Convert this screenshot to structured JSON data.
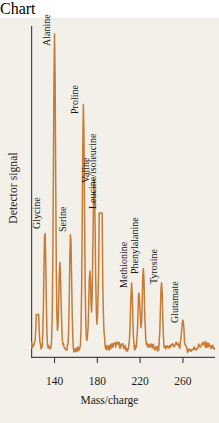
{
  "chart_data": {
    "type": "line",
    "title": "",
    "xlabel": "Mass/charge",
    "ylabel": "Detector signal",
    "xlim": [
      118,
      290
    ],
    "ylim": [
      0,
      100
    ],
    "grid": false,
    "legend": "none",
    "xticks": [
      140,
      180,
      220,
      260
    ],
    "xtick_labels": [
      "140",
      "180",
      "220",
      "260"
    ],
    "yticks": [],
    "ytick_labels": [],
    "series_name": "Detector signal",
    "trace_color": "#c77b35",
    "background_color": "#f3f0ea",
    "axis_color": "#3a3a3a",
    "baseline_level": 3,
    "peaks": [
      {
        "mz": 124,
        "height": 13,
        "width": 2.2,
        "label": "",
        "flat_top": true
      },
      {
        "mz": 131,
        "height": 37,
        "width": 1.8,
        "label": "Glycine",
        "label_y": 42
      },
      {
        "mz": 140,
        "height": 95,
        "width": 1.8,
        "label": "Alanine",
        "label_y": 98
      },
      {
        "mz": 145,
        "height": 26,
        "width": 1.8,
        "label": "",
        "label_y": 0
      },
      {
        "mz": 155,
        "height": 36,
        "width": 1.8,
        "label": "Serine",
        "label_y": 41
      },
      {
        "mz": 167,
        "height": 73,
        "width": 1.8,
        "label": "Proline",
        "label_y": 77
      },
      {
        "mz": 173,
        "height": 23,
        "width": 1.8,
        "label": "",
        "label_y": 0
      },
      {
        "mz": 177,
        "height": 52,
        "width": 2.0,
        "label": "Valine",
        "label_y": 56
      },
      {
        "mz": 183,
        "height": 44,
        "width": 3.0,
        "label": "Leucine/isoleucine",
        "label_y": 48,
        "flat_top": true
      },
      {
        "mz": 212,
        "height": 20,
        "width": 1.8,
        "label": "Methionine",
        "label_y": 24
      },
      {
        "mz": 219,
        "height": 17,
        "width": 1.8,
        "label": "",
        "label_y": 0
      },
      {
        "mz": 223,
        "height": 24,
        "width": 1.8,
        "label": "Phenylalanine",
        "label_y": 28
      },
      {
        "mz": 240,
        "height": 21,
        "width": 1.8,
        "label": "Tyrosine",
        "label_y": 25
      },
      {
        "mz": 260,
        "height": 9,
        "width": 1.8,
        "label": "Glutamate",
        "label_y": 13
      }
    ],
    "annotations": [
      "Glycine",
      "Alanine",
      "Serine",
      "Proline",
      "Valine",
      "Leucine/isoleucine",
      "Methionine",
      "Phenylalanine",
      "Tyrosine",
      "Glutamate"
    ]
  },
  "axes": {
    "y_title": "Detector signal",
    "x_title": "Mass/charge"
  }
}
